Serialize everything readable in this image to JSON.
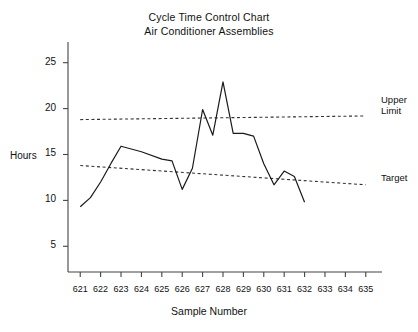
{
  "chart_data": {
    "type": "line",
    "title": "Cycle Time Control Chart",
    "subtitle": "Air Conditioner Assemblies",
    "xlabel": "Sample Number",
    "ylabel": "Hours",
    "grid": false,
    "legend_position": "right-inline",
    "xlim": [
      620.4,
      635.6
    ],
    "ylim": [
      2.2,
      26.6
    ],
    "yticks": [
      5,
      10,
      15,
      20,
      25
    ],
    "xticks": [
      621,
      622,
      623,
      624,
      625,
      626,
      627,
      628,
      629,
      630,
      631,
      632,
      633,
      634,
      635
    ],
    "categories": [
      621,
      621.5,
      622,
      622.5,
      623,
      624,
      625,
      625.5,
      626,
      626.5,
      627,
      627.5,
      628,
      628.5,
      629,
      629.5,
      630,
      630.5,
      631,
      631.5,
      632
    ],
    "series": [
      {
        "name": "Cycle Time",
        "values": [
          9.3,
          10.3,
          12.0,
          14.0,
          15.9,
          15.3,
          14.5,
          14.3,
          11.2,
          13.5,
          19.9,
          17.1,
          22.9,
          17.3,
          17.3,
          17.0,
          14.0,
          11.7,
          13.2,
          12.6,
          9.8
        ]
      }
    ],
    "reference_lines": [
      {
        "name": "Upper Limit",
        "label": "Upper Limit",
        "label_line1": "Upper",
        "label_line2": "Limit",
        "style": "dashed",
        "value_start": 18.8,
        "value_end": 19.2,
        "x_start": 621,
        "x_end": 635
      },
      {
        "name": "Target",
        "label": "Target",
        "style": "dashed",
        "value_start": 13.8,
        "value_end": 11.7,
        "x_start": 621,
        "x_end": 635
      }
    ],
    "colors": {
      "line": "#1a1a1a",
      "reference": "#333333",
      "axis": "#444444",
      "background": "#ffffff"
    }
  }
}
